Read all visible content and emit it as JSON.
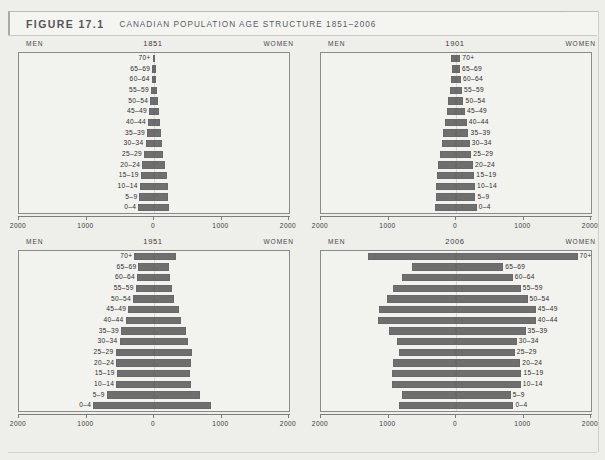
{
  "header": {
    "figure_number": "FIGURE 17.1",
    "title": "CANADIAN POPULATION AGE STRUCTURE 1851–2006"
  },
  "labels": {
    "men": "MEN",
    "women": "WOMEN"
  },
  "axis_ticks": [
    "2000",
    "1000",
    "0",
    "1000",
    "2000"
  ],
  "age_groups": [
    "70+",
    "65–69",
    "60–64",
    "55–59",
    "50–54",
    "45–49",
    "40–44",
    "35–39",
    "30–34",
    "25–29",
    "20–24",
    "15–19",
    "10–14",
    "5–9",
    "0–4"
  ],
  "colors": {
    "bar": "#6f6f6f",
    "plot_background": "#f2f2ee",
    "page_background": "#eeeeea",
    "axis": "#7d7d7d"
  },
  "chart_data": [
    {
      "type": "bar",
      "subtype": "population-pyramid",
      "title": "1851",
      "xlabel": "",
      "ylabel": "",
      "xlim": [
        -2000,
        2000
      ],
      "grid": false,
      "label_side": "left",
      "categories": [
        "70+",
        "65–69",
        "60–64",
        "55–59",
        "50–54",
        "45–49",
        "40–44",
        "35–39",
        "30–34",
        "25–29",
        "20–24",
        "15–19",
        "10–14",
        "5–9",
        "0–4"
      ],
      "series": [
        {
          "name": "MEN",
          "values": [
            20,
            26,
            34,
            44,
            56,
            72,
            88,
            104,
            124,
            146,
            172,
            196,
            212,
            216,
            232
          ]
        },
        {
          "name": "WOMEN",
          "values": [
            20,
            24,
            32,
            42,
            54,
            68,
            84,
            100,
            118,
            140,
            164,
            186,
            202,
            208,
            226
          ]
        }
      ]
    },
    {
      "type": "bar",
      "subtype": "population-pyramid",
      "title": "1901",
      "xlabel": "",
      "ylabel": "",
      "xlim": [
        -2000,
        2000
      ],
      "grid": false,
      "label_side": "right",
      "categories": [
        "70+",
        "65–69",
        "60–64",
        "55–59",
        "50–54",
        "45–49",
        "40–44",
        "35–39",
        "30–34",
        "25–29",
        "20–24",
        "15–19",
        "10–14",
        "5–9",
        "0–4"
      ],
      "series": [
        {
          "name": "MEN",
          "values": [
            68,
            62,
            78,
            92,
            116,
            140,
            170,
            196,
            214,
            238,
            262,
            286,
            292,
            300,
            318
          ]
        },
        {
          "name": "WOMEN",
          "values": [
            64,
            58,
            74,
            88,
            110,
            132,
            160,
            184,
            204,
            226,
            250,
            272,
            280,
            288,
            306
          ]
        }
      ]
    },
    {
      "type": "bar",
      "subtype": "population-pyramid",
      "title": "1951",
      "xlabel": "",
      "ylabel": "",
      "xlim": [
        -2000,
        2000
      ],
      "grid": false,
      "label_side": "left",
      "categories": [
        "70+",
        "65–69",
        "60–64",
        "55–59",
        "50–54",
        "45–49",
        "40–44",
        "35–39",
        "30–34",
        "25–29",
        "20–24",
        "15–19",
        "10–14",
        "5–9",
        "0–4"
      ],
      "series": [
        {
          "name": "MEN",
          "values": [
            290,
            230,
            250,
            270,
            310,
            380,
            420,
            490,
            510,
            570,
            560,
            550,
            560,
            700,
            900
          ]
        },
        {
          "name": "WOMEN",
          "values": [
            330,
            215,
            240,
            260,
            300,
            370,
            405,
            470,
            500,
            560,
            545,
            540,
            550,
            680,
            840
          ]
        }
      ]
    },
    {
      "type": "bar",
      "subtype": "population-pyramid",
      "title": "2006",
      "xlabel": "",
      "ylabel": "",
      "xlim": [
        -2000,
        2000
      ],
      "grid": false,
      "label_side": "right",
      "categories": [
        "70+",
        "65–69",
        "60–64",
        "55–59",
        "50–54",
        "45–49",
        "40–44",
        "35–39",
        "30–34",
        "25–29",
        "20–24",
        "15–19",
        "10–14",
        "5–9",
        "0–4"
      ],
      "series": [
        {
          "name": "MEN",
          "values": [
            1310,
            650,
            800,
            930,
            1020,
            1140,
            1150,
            1000,
            880,
            850,
            930,
            950,
            950,
            800,
            840
          ]
        },
        {
          "name": "WOMEN",
          "values": [
            1800,
            700,
            840,
            960,
            1060,
            1180,
            1180,
            1030,
            900,
            870,
            950,
            970,
            960,
            810,
            850
          ]
        }
      ]
    }
  ]
}
